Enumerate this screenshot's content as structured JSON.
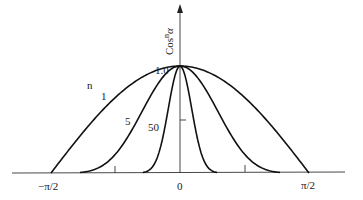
{
  "chart_data": {
    "type": "line",
    "title": "",
    "xlabel": "",
    "ylabel": "Cosⁿα",
    "xlim": [
      -1.5708,
      1.5708
    ],
    "ylim": [
      0,
      1.0
    ],
    "x_tick_labels": [
      "-π/2",
      "0",
      "π/2"
    ],
    "x_ticks": [
      -1.5708,
      -0.7854,
      0,
      0.7854,
      1.5708
    ],
    "y_tick_labels": [
      "1.0"
    ],
    "y_ticks": [
      0.5,
      1.0
    ],
    "grid": false,
    "legend_label": "n",
    "series": [
      {
        "name": "1",
        "n": 1,
        "function": "cos^1(α)",
        "points": [
          [
            -1.5708,
            0
          ],
          [
            -0.7854,
            0.707
          ],
          [
            0,
            1
          ],
          [
            0.7854,
            0.707
          ],
          [
            1.5708,
            0
          ]
        ]
      },
      {
        "name": "5",
        "n": 5,
        "function": "cos^5(α)",
        "points": [
          [
            -1.5708,
            0
          ],
          [
            -0.7854,
            0.177
          ],
          [
            0,
            1
          ],
          [
            0.7854,
            0.177
          ],
          [
            1.5708,
            0
          ]
        ]
      },
      {
        "name": "50",
        "n": 50,
        "function": "cos^50(α)",
        "points": [
          [
            -0.5,
            0.0026
          ],
          [
            -0.25,
            0.21
          ],
          [
            0,
            1
          ],
          [
            0.25,
            0.21
          ],
          [
            0.5,
            0.0026
          ]
        ]
      }
    ]
  },
  "labels": {
    "y_axis": "Cos",
    "y_axis_exp": "n",
    "y_axis_var": "α",
    "y_max": "1.0",
    "x_min": "−π/2",
    "x_zero": "0",
    "x_max": "π/2",
    "n_label": "n",
    "curve_1": "1",
    "curve_5": "5",
    "curve_50": "50"
  }
}
